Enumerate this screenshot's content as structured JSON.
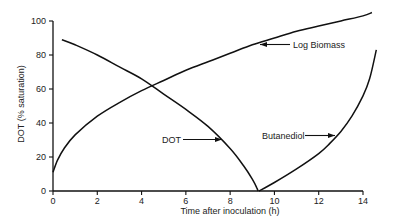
{
  "chart_data": {
    "type": "line",
    "title": "",
    "xlabel": "Time after inoculation (h)",
    "ylabel": "DOT (% saturation)",
    "xlim": [
      0,
      14
    ],
    "ylim": [
      0,
      100
    ],
    "xticks": [
      0,
      2,
      4,
      6,
      8,
      10,
      12,
      14
    ],
    "yticks": [
      0,
      20,
      40,
      60,
      80,
      100
    ],
    "grid": false,
    "legend": "none",
    "series": [
      {
        "name": "DOT",
        "x": [
          0.4,
          1,
          2,
          3,
          4,
          5,
          6,
          7,
          8,
          8.6,
          9.0,
          9.2,
          9.26
        ],
        "y": [
          89,
          86,
          80,
          73,
          66,
          57,
          48,
          38,
          25,
          15,
          7,
          2,
          0
        ]
      },
      {
        "name": "Log Biomass",
        "x": [
          0,
          0.2,
          0.5,
          1,
          2,
          3,
          4,
          5,
          6,
          7,
          8,
          9,
          10,
          11,
          12,
          13,
          14,
          14.4
        ],
        "y": [
          11,
          18,
          25,
          33,
          44,
          52,
          59,
          65,
          71,
          76,
          81,
          86,
          90,
          94,
          97,
          100,
          103,
          105
        ]
      },
      {
        "name": "Butanediol",
        "x": [
          9.3,
          10,
          11,
          12,
          12.5,
          13,
          13.5,
          14,
          14.3,
          14.6
        ],
        "y": [
          0,
          5,
          13,
          22,
          28,
          35,
          44,
          56,
          66,
          83
        ]
      }
    ],
    "annotations": [
      {
        "text": "Log Biomass",
        "target_series": "Log Biomass",
        "arrow": "left"
      },
      {
        "text": "DOT",
        "target_series": "DOT",
        "arrow": "right"
      },
      {
        "text": "Butanediol",
        "target_series": "Butanediol",
        "arrow": "right"
      }
    ]
  }
}
